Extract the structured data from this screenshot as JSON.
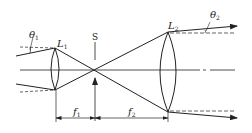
{
  "diagram": {
    "type": "optical-beam-expander",
    "labels": {
      "theta1": "θ",
      "theta1_sub": "1",
      "theta2": "θ",
      "theta2_sub": "2",
      "lens1": "L",
      "lens1_sub": "1",
      "lens2": "L",
      "lens2_sub": "2",
      "stop": "S",
      "f1": "f",
      "f1_sub": "1",
      "f2": "f",
      "f2_sub": "2"
    },
    "colors": {
      "line": "#222222",
      "background": "#ffffff"
    }
  }
}
